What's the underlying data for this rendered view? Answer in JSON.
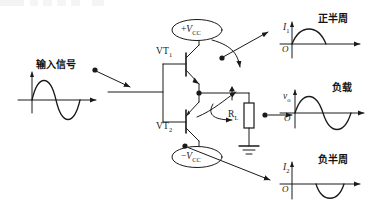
{
  "figure": {
    "kind": "circuit-diagram",
    "background_color": "#ffffff",
    "line_color": "#1a1a1a"
  },
  "input": {
    "label": "输入信号",
    "waveform": {
      "kind": "full-sine",
      "axis_y_label": "",
      "axis_x_label": ""
    }
  },
  "circuit": {
    "supply_positive": {
      "sign": "+",
      "symbol": "V",
      "subscript": "CC"
    },
    "supply_negative": {
      "sign": "−",
      "symbol": "V",
      "subscript": "CC"
    },
    "transistor_upper": {
      "name": "VT",
      "subscript": "1"
    },
    "transistor_lower": {
      "name": "VT",
      "subscript": "2"
    },
    "load_resistor": {
      "name": "R",
      "subscript": "L"
    },
    "ground": "ground-symbol"
  },
  "waveforms": [
    {
      "id": "positive-half-cycle",
      "title": "正半周",
      "axis_y_label": "I",
      "axis_y_subscript": "1",
      "origin_label": "O",
      "shape": "positive-half-sine"
    },
    {
      "id": "load-output",
      "title": "负载",
      "axis_y_label": "v",
      "axis_y_subscript": "o",
      "origin_label": "O",
      "shape": "full-sine"
    },
    {
      "id": "negative-half-cycle",
      "title": "负半周",
      "axis_y_label": "I",
      "axis_y_subscript": "2",
      "origin_label": "O",
      "shape": "negative-half-sine"
    }
  ]
}
